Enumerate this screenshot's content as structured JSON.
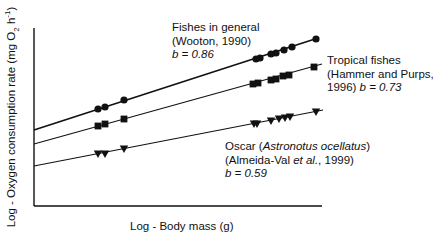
{
  "chart_data": {
    "type": "line",
    "title": "",
    "xlabel": "Log - Body mass (g)",
    "ylabel": "Log - Oxygen consumption rate (mg O2 h-1)",
    "ylabel_parts": {
      "pre": "Log - Oxygen consumption rate (mg O",
      "sub": "2",
      "mid": " h",
      "sup": "-1",
      "post": ")"
    },
    "grid": false,
    "legend": "inline annotations",
    "axis_ticks": "none (unlabeled log axes)",
    "series": [
      {
        "name": "Fishes in general",
        "citation": "(Wooton, 1990)",
        "slope_label": "b = 0.86",
        "b": 0.86,
        "marker": "circle",
        "line": {
          "x1": 34,
          "y1": 130,
          "x2": 318,
          "y2": 38,
          "width": 1.6
        },
        "points_px": [
          [
            98,
            109
          ],
          [
            105,
            107
          ],
          [
            124,
            100
          ],
          [
            256,
            59
          ],
          [
            260,
            58
          ],
          [
            271,
            54
          ],
          [
            276,
            53
          ],
          [
            284,
            50
          ],
          [
            292,
            47
          ],
          [
            316,
            39
          ]
        ]
      },
      {
        "name": "Tropical fishes",
        "citation": "(Hammer and Purps, 1996)",
        "slope_label": "b = 0.73",
        "b": 0.73,
        "marker": "square",
        "line": {
          "x1": 34,
          "y1": 144,
          "x2": 322,
          "y2": 64,
          "width": 1.1
        },
        "points_px": [
          [
            98,
            126
          ],
          [
            105,
            124
          ],
          [
            124,
            119
          ],
          [
            253,
            84
          ],
          [
            258,
            83
          ],
          [
            271,
            80
          ],
          [
            276,
            79
          ],
          [
            283,
            76
          ],
          [
            289,
            75
          ],
          [
            314,
            67
          ]
        ]
      },
      {
        "name": "Oscar (Astronotus ocellatus)",
        "citation": "(Almeida-Val et al., 1999)",
        "slope_label": "b = 0.59",
        "b": 0.59,
        "marker": "triangle-down",
        "line": {
          "x1": 34,
          "y1": 166,
          "x2": 323,
          "y2": 110,
          "width": 1.1
        },
        "points_px": [
          [
            98,
            154
          ],
          [
            105,
            154
          ],
          [
            124,
            149
          ],
          [
            254,
            124
          ],
          [
            257,
            124
          ],
          [
            271,
            121
          ],
          [
            279,
            119
          ],
          [
            285,
            118
          ],
          [
            290,
            117
          ],
          [
            316,
            112
          ]
        ]
      }
    ]
  },
  "annotations": {
    "fishes": {
      "line1": "Fishes in general",
      "line2": "(Wooton, 1990)",
      "line3": "b = 0.86"
    },
    "tropical": {
      "line1": "Tropical fishes",
      "line2": "(Hammer and Purps,",
      "line3a": "1996) ",
      "line3b": "b = 0.73"
    },
    "oscar": {
      "line1a": "Oscar (",
      "line1b": "Astronotus ocellatus",
      "line1c": ")",
      "line2a": "(Almeida-Val ",
      "line2b": "et al.",
      "line2c": ", 1999)",
      "line3": "b = 0.59"
    }
  }
}
